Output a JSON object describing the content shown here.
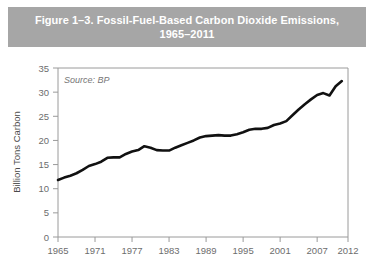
{
  "figure": {
    "title": "Figure 1–3. Fossil-Fuel-Based Carbon Dioxide Emissions,\n1965–2011",
    "banner_color": "#a6a6a6",
    "title_color": "#ffffff"
  },
  "chart_data": {
    "type": "line",
    "title": "Figure 1–3. Fossil-Fuel-Based Carbon Dioxide Emissions, 1965–2011",
    "source_note": "Source: BP",
    "xlabel": "",
    "ylabel": "Billion Tons Carbon",
    "xlim": [
      1965,
      2012
    ],
    "ylim": [
      0,
      35
    ],
    "ytick_labels": [
      "0",
      "5",
      "10",
      "15",
      "20",
      "25",
      "30",
      "35"
    ],
    "yticks": [
      0,
      5,
      10,
      15,
      20,
      25,
      30,
      35
    ],
    "xtick_labels": [
      "1965",
      "1971",
      "1977",
      "1983",
      "1989",
      "1995",
      "2001",
      "2007",
      "2012"
    ],
    "xticks": [
      1965,
      1971,
      1977,
      1983,
      1989,
      1995,
      2001,
      2007,
      2012
    ],
    "grid": false,
    "legend": false,
    "line_color": "#111111",
    "axis_color": "#9a9a9a",
    "series": [
      {
        "name": "Fossil-Fuel-Based Carbon Dioxide Emissions",
        "x": [
          1965,
          1966,
          1967,
          1968,
          1969,
          1970,
          1971,
          1972,
          1973,
          1974,
          1975,
          1976,
          1977,
          1978,
          1979,
          1980,
          1981,
          1982,
          1983,
          1984,
          1985,
          1986,
          1987,
          1988,
          1989,
          1990,
          1991,
          1992,
          1993,
          1994,
          1995,
          1996,
          1997,
          1998,
          1999,
          2000,
          2001,
          2002,
          2003,
          2004,
          2005,
          2006,
          2007,
          2008,
          2009,
          2010,
          2011
        ],
        "values": [
          11.8,
          12.3,
          12.7,
          13.2,
          13.9,
          14.7,
          15.1,
          15.6,
          16.4,
          16.5,
          16.5,
          17.2,
          17.7,
          18.0,
          18.8,
          18.5,
          18.0,
          17.9,
          17.9,
          18.5,
          19.0,
          19.5,
          20.0,
          20.6,
          20.9,
          21.0,
          21.1,
          21.0,
          21.0,
          21.3,
          21.7,
          22.2,
          22.4,
          22.4,
          22.6,
          23.2,
          23.5,
          24.0,
          25.2,
          26.4,
          27.5,
          28.5,
          29.4,
          29.8,
          29.3,
          31.2,
          32.3
        ],
        "unit": "billion tons carbon"
      }
    ],
    "start_value": 11.8,
    "end_value": 33.5
  }
}
